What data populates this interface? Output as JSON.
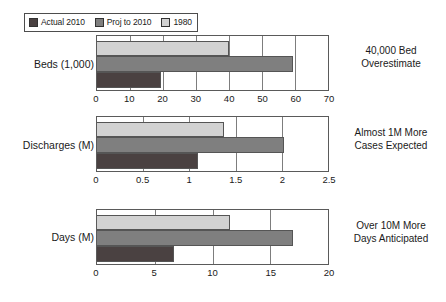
{
  "legend": {
    "entries": [
      {
        "label": "Actual 2010",
        "color": "#4a4141",
        "key": "actual"
      },
      {
        "label": "Proj to 2010",
        "color": "#7f7f7f",
        "key": "proj"
      },
      {
        "label": "1980",
        "color": "#d2d2d2",
        "key": "y1980"
      }
    ]
  },
  "chart_data": [
    {
      "type": "bar",
      "title": "Beds (1,000)",
      "orientation": "horizontal",
      "xlabel": "",
      "ylabel": "Beds (1,000)",
      "xlim": [
        0,
        70
      ],
      "ticks": [
        0,
        10,
        20,
        30,
        40,
        50,
        60,
        70
      ],
      "tick_labels": [
        "0",
        "10",
        "20",
        "30",
        "40",
        "50",
        "60",
        "70"
      ],
      "grid": true,
      "legend_position": "top-left",
      "categories": [
        "Beds (1,000)"
      ],
      "series": [
        {
          "name": "1980",
          "values": [
            40.0
          ]
        },
        {
          "name": "Proj to 2010",
          "values": [
            59.5
          ]
        },
        {
          "name": "Actual 2010",
          "values": [
            19.5
          ]
        }
      ],
      "annotation": [
        "40,000 Bed",
        "Overestimate"
      ]
    },
    {
      "type": "bar",
      "title": "Discharges (M)",
      "orientation": "horizontal",
      "xlabel": "",
      "ylabel": "Discharges (M)",
      "xlim": [
        0,
        2.5
      ],
      "ticks": [
        0,
        0.5,
        1,
        1.5,
        2,
        2.5
      ],
      "tick_labels": [
        "0",
        "0.5",
        "1",
        "1.5",
        "2",
        "2.5"
      ],
      "grid": true,
      "legend_position": "none",
      "categories": [
        "Discharges (M)"
      ],
      "series": [
        {
          "name": "1980",
          "values": [
            1.37
          ]
        },
        {
          "name": "Proj to 2010",
          "values": [
            2.02
          ]
        },
        {
          "name": "Actual 2010",
          "values": [
            1.09
          ]
        }
      ],
      "annotation": [
        "Almost 1M More",
        "Cases Expected"
      ]
    },
    {
      "type": "bar",
      "title": "Days (M)",
      "orientation": "horizontal",
      "xlabel": "",
      "ylabel": "Days (M)",
      "xlim": [
        0,
        20
      ],
      "ticks": [
        0,
        5,
        10,
        15,
        20
      ],
      "tick_labels": [
        "0",
        "5",
        "10",
        "15",
        "20"
      ],
      "grid": true,
      "legend_position": "none",
      "categories": [
        "Days (M)"
      ],
      "series": [
        {
          "name": "1980",
          "values": [
            11.5
          ]
        },
        {
          "name": "Proj to 2010",
          "values": [
            17.0
          ]
        },
        {
          "name": "Actual 2010",
          "values": [
            6.7
          ]
        }
      ],
      "annotation": [
        "Over 10M More",
        "Days Anticipated"
      ]
    }
  ]
}
